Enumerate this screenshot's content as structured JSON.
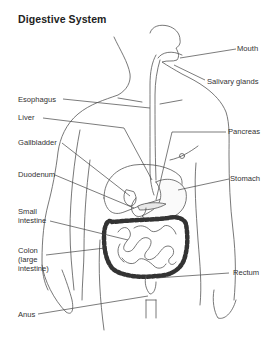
{
  "title": "Digestive System",
  "labels": {
    "mouth": "Mouth",
    "salivary_glands": "Salivary glands",
    "esophagus": "Esophagus",
    "liver": "Liver",
    "gallbladder": "Gallbladder",
    "pancreas": "Pancreas",
    "duodenum": "Duodenum",
    "stomach": "Stomach",
    "small_intestine_1": "Small",
    "small_intestine_2": "intestine",
    "colon_1": "Colon",
    "colon_2": "(large",
    "colon_3": "intestine)",
    "rectum": "Rectum",
    "anus": "Anus"
  },
  "colors": {
    "line": "#444444",
    "text": "#333333",
    "colon_fill": "#555555"
  }
}
